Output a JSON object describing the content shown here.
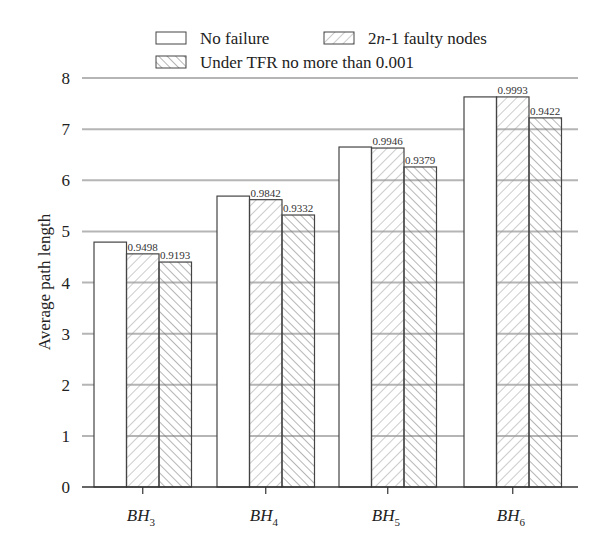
{
  "chart_data": {
    "type": "bar",
    "title": "",
    "xlabel": "",
    "ylabel": "Average path length",
    "ylim": [
      0,
      8
    ],
    "yticks": [
      "0",
      "1",
      "2",
      "3",
      "4",
      "5",
      "6",
      "7",
      "8"
    ],
    "grid": "horizontal",
    "legend_position": "top",
    "categories": [
      {
        "base": "BH",
        "sub": "3"
      },
      {
        "base": "BH",
        "sub": "4"
      },
      {
        "base": "BH",
        "sub": "5"
      },
      {
        "base": "BH",
        "sub": "6"
      }
    ],
    "series": [
      {
        "name": "No failure",
        "legend_main": "No failure",
        "legend_italic": "",
        "legend_rest": "",
        "pattern": "none",
        "values": [
          4.79,
          5.69,
          6.65,
          7.63
        ],
        "labels": [
          "",
          "",
          "",
          ""
        ]
      },
      {
        "name": "2n-1 faulty nodes",
        "legend_main": "2",
        "legend_italic": "n",
        "legend_rest": "-1 faulty nodes",
        "pattern": "forward",
        "values": [
          4.56,
          5.62,
          6.63,
          7.63
        ],
        "labels": [
          "0.9498",
          "0.9842",
          "0.9946",
          "0.9993"
        ]
      },
      {
        "name": "Under TFR no more than 0.001",
        "legend_main": "Under TFR no more than 0.001",
        "legend_italic": "",
        "legend_rest": "",
        "pattern": "backward",
        "values": [
          4.4,
          5.32,
          6.26,
          7.22
        ],
        "labels": [
          "0.9193",
          "0.9332",
          "0.9379",
          "0.9422"
        ]
      }
    ],
    "colors": {
      "bar_stroke": "#444444",
      "hatch": "#8a8a8a",
      "grid": "#b5b5b5",
      "axis": "#333333"
    }
  }
}
